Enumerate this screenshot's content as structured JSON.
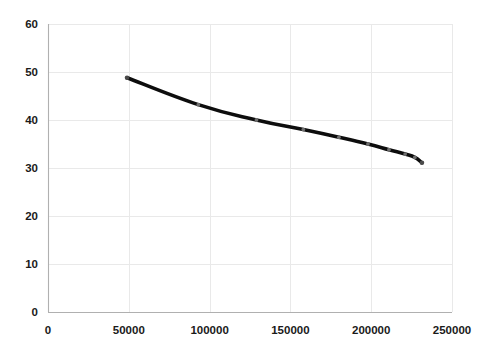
{
  "chart_data": {
    "type": "line",
    "title": "",
    "subtitle": "",
    "xlabel": "",
    "ylabel": "",
    "xlim": [
      0,
      250000
    ],
    "ylim": [
      0,
      60
    ],
    "grid": true,
    "legend": null,
    "legend_position": "none",
    "x_ticks": [
      0,
      50000,
      100000,
      150000,
      200000,
      250000
    ],
    "x_tick_labels": [
      "0",
      "50000",
      "100000",
      "150000",
      "200000",
      "250000"
    ],
    "y_ticks": [
      0,
      10,
      20,
      30,
      40,
      50,
      60
    ],
    "y_tick_labels": [
      "0",
      "10",
      "20",
      "30",
      "40",
      "50",
      "60"
    ],
    "series": [
      {
        "name": "series-1",
        "color": "#0d0d0d",
        "marker_color": "#6f6f6f",
        "x": [
          48900,
          93000,
          129000,
          158000,
          180000,
          198000,
          211000,
          221000,
          227000,
          231400
        ],
        "y": [
          48.8,
          43.2,
          40.0,
          38.0,
          36.4,
          35.0,
          33.8,
          32.9,
          32.2,
          31.1
        ]
      }
    ]
  },
  "plot_area": {
    "left": 48,
    "top": 24,
    "right": 452,
    "bottom": 312
  },
  "colors": {
    "line": "#0d0d0d",
    "marker": "#6f6f6f",
    "grid": "#e9e9e9",
    "axis": "#b0b0b0",
    "text": "#1a1a1a",
    "background": "#ffffff"
  }
}
